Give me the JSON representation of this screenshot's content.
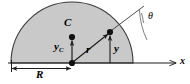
{
  "figure": {
    "type": "geometry-diagram",
    "labels": {
      "centroid": "C",
      "centroid_height": "y",
      "centroid_height_sub": "C",
      "radius_vector": "r",
      "element_height": "y",
      "radius": "R",
      "x_axis": "x",
      "angle": "θ"
    },
    "colors": {
      "fill": "#c9c9c9",
      "stroke": "#2b2b2b",
      "background": "#ffffff",
      "text": "#000000"
    },
    "geometry": {
      "origin_x": 72,
      "origin_y": 63,
      "radius_px": 61,
      "centroid_y_px": 37,
      "element_point_x": 110,
      "element_point_y": 32,
      "axis_end_x": 178,
      "angle_deg": 37
    }
  }
}
